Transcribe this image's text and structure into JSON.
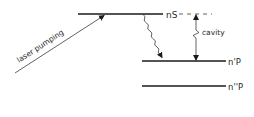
{
  "diagram": {
    "type": "energy-level-diagram",
    "levels": [
      {
        "id": "nS",
        "label": "nS"
      },
      {
        "id": "n1P",
        "label": "n'P"
      },
      {
        "id": "n2P",
        "label": "n''P"
      }
    ],
    "annotations": {
      "laser": "laser pumping",
      "cavity_line1": "cavity",
      "cavity_line2": "tuning"
    },
    "colors": {
      "line": "#1a1a1a",
      "thin_line": "#3a3a3a",
      "background": "#ffffff"
    }
  }
}
